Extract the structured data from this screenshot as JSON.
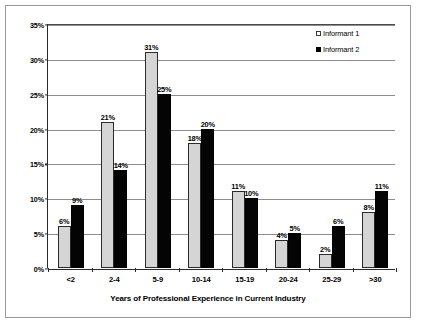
{
  "chart_data": {
    "type": "bar",
    "title": "",
    "xlabel": "Years of Professional Experience in Current Industry",
    "ylabel": "",
    "categories": [
      "<2",
      "2-4",
      "5-9",
      "10-14",
      "15-19",
      "20-24",
      "25-29",
      ">30"
    ],
    "series": [
      {
        "name": "Informant 1",
        "color": "#d5d5d5",
        "values": [
          6,
          21,
          31,
          18,
          11,
          4,
          2,
          8
        ],
        "labels": [
          "6%",
          "21%",
          "31%",
          "18%",
          "11%",
          "4%",
          "2%",
          "8%"
        ]
      },
      {
        "name": "Informant 2",
        "color": "#000000",
        "values": [
          9,
          14,
          25,
          20,
          10,
          5,
          6,
          11
        ],
        "labels": [
          "9%",
          "14%",
          "25%",
          "20%",
          "10%",
          "5%",
          "6%",
          "11%"
        ]
      }
    ],
    "ylim": [
      0,
      35
    ],
    "ytick_values": [
      0,
      5,
      10,
      15,
      20,
      25,
      30,
      35
    ],
    "ytick_labels": [
      "0%",
      "5%",
      "10%",
      "15%",
      "20%",
      "25%",
      "30%",
      "35%"
    ],
    "grid": true,
    "legend_position": "top-right",
    "value_labels_shown": true
  }
}
